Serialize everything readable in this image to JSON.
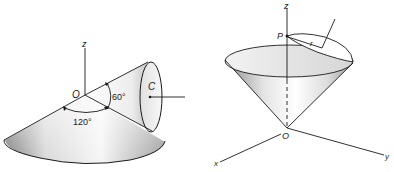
{
  "figures": [
    {
      "id": "left",
      "description": "Cone with apex at O, axis through C, half-angle 60 deg; wide cone with 120 deg opening",
      "labels": {
        "axis_z": "z",
        "origin": "O",
        "center": "C",
        "angle_small": "60°",
        "angle_large": "120°"
      }
    },
    {
      "id": "right",
      "description": "Upright cone with apex at origin O, point P on z-axis, small circle of radius r tangent at P",
      "labels": {
        "axis_z": "z",
        "axis_x": "x",
        "axis_y": "y",
        "origin": "O",
        "point": "P",
        "radius": "r"
      }
    }
  ],
  "colors": {
    "stroke": "#1a1a1a",
    "shade_dark": "#8a8a8a",
    "shade_light": "#f4f4f4"
  }
}
